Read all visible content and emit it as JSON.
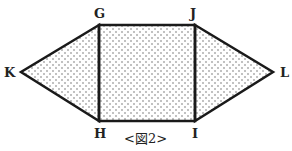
{
  "figure": {
    "caption": "<図2>",
    "labels": {
      "G": "G",
      "J": "J",
      "H": "H",
      "I": "I",
      "K": "K",
      "L": "L"
    },
    "shapes": [
      {
        "name": "square",
        "vertices": [
          "G",
          "J",
          "I",
          "H"
        ],
        "fill": "dotted"
      },
      {
        "name": "left-triangle",
        "vertices": [
          "G",
          "K",
          "H"
        ],
        "fill": "dotted"
      },
      {
        "name": "right-triangle",
        "vertices": [
          "J",
          "L",
          "I"
        ],
        "fill": "dotted"
      }
    ],
    "colors": {
      "stroke": "#1a1a1a",
      "dots": "#555555",
      "background": "#ffffff"
    }
  }
}
